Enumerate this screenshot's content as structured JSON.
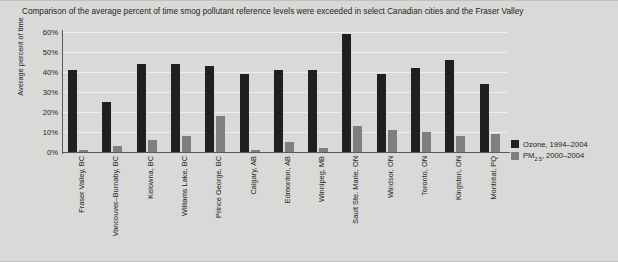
{
  "chart_data": {
    "type": "bar",
    "title": "Comparison of the average percent of time smog pollutant reference levels were exceeded in select Canadian cities and the Fraser Valley",
    "xlabel": "",
    "ylabel": "Average percent of time",
    "ylim": [
      0,
      60
    ],
    "ytick_labels": [
      "60%",
      "50%",
      "40%",
      "30%",
      "20%",
      "10%",
      "0%"
    ],
    "ytick_values": [
      60,
      50,
      40,
      30,
      20,
      10,
      0
    ],
    "grid": true,
    "legend_position": "right",
    "categories": [
      "Fraser Valley, BC",
      "Vancouver–Burnaby, BC",
      "Kelowna, BC",
      "Williams Lake, BC",
      "Prince George, BC",
      "Calgary, AB",
      "Edmonton, AB",
      "Winnipeg, MB",
      "Sault Ste. Marie, ON",
      "Windsor, ON",
      "Toronto, ON",
      "Kingston, ON",
      "Montréal, PQ"
    ],
    "series": [
      {
        "name": "Ozone, 1994–2004",
        "color": "#231f20",
        "values": [
          41,
          25,
          44,
          44,
          43,
          39,
          41,
          41,
          59,
          39,
          42,
          46,
          34
        ]
      },
      {
        "name": "PM2.5, 2000–2004",
        "color": "#7d7f81",
        "values": [
          1,
          3,
          6,
          8,
          18,
          1,
          5,
          2,
          13,
          11,
          10,
          8,
          9
        ]
      }
    ],
    "legend": [
      {
        "label": "Ozone, 1994–2004",
        "color": "#231f20"
      },
      {
        "label_prefix": "PM",
        "label_sub": "2.5",
        "label_suffix": ", 2000–2004",
        "color": "#7d7f81"
      }
    ]
  },
  "colors": {
    "background": "#d9d9d7",
    "ozone": "#231f20",
    "pm25": "#7d7f81",
    "axis": "#5a5a58",
    "text": "#231f20"
  }
}
